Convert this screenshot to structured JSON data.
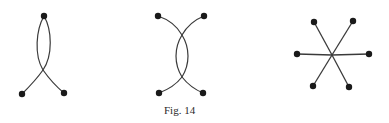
{
  "figure": {
    "caption": "Fig. 14",
    "ink_color": "#1a1a1a",
    "stroke_color": "#3a3a3a",
    "panels": [
      {
        "id": "graph-a",
        "description": "two curves joined at a top vertex, crossing once before ending at two bottom vertices",
        "vertices": [
          [
            44,
            16
          ],
          [
            22,
            94
          ],
          [
            64,
            93
          ]
        ],
        "edges": [
          "M44 16 C36 30, 34 55, 43 70 C50 80, 58 88, 64 93",
          "M44 16 C52 30, 53 55, 43 70 C36 80, 28 88, 22 94"
        ]
      },
      {
        "id": "graph-b",
        "description": "two arcs crossing twice, four end vertices",
        "vertices": [
          [
            158,
            16
          ],
          [
            204,
            16
          ],
          [
            159,
            93
          ],
          [
            203,
            93
          ]
        ],
        "edges": [
          "M158 16 C170 20, 178 28, 182 35 C190 48, 190 64, 182 77 C189 86, 196 90, 203 93",
          "M204 16 C194 20, 186 28, 182 35 C174 48, 174 64, 182 77 C175 86, 167 90, 159 93"
        ]
      },
      {
        "id": "graph-c",
        "description": "six spokes from a central point",
        "center": [
          332,
          55
        ],
        "vertices": [
          [
            314,
            22
          ],
          [
            353,
            21
          ],
          [
            297,
            54
          ],
          [
            369,
            54
          ],
          [
            313,
            86
          ],
          [
            349,
            87
          ]
        ]
      }
    ]
  }
}
